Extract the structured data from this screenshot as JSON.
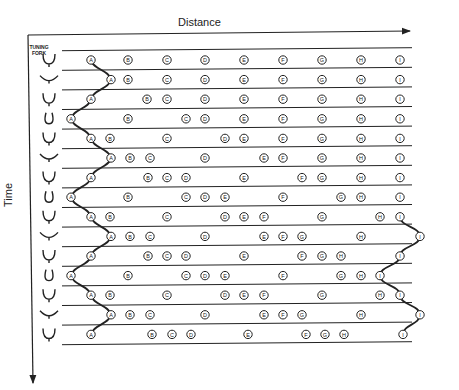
{
  "diagram": {
    "axes": {
      "x_label": "Distance",
      "y_label": "Time"
    },
    "fork_column_label": "TUNING FORK",
    "particle_labels": [
      "A",
      "B",
      "C",
      "D",
      "E",
      "F",
      "G",
      "H",
      "I"
    ],
    "rows": [
      {
        "fork_state": "neutral",
        "x": [
          91,
          128,
          167,
          205,
          244,
          283,
          322,
          361,
          400
        ]
      },
      {
        "fork_state": "spread",
        "x": [
          111,
          128,
          167,
          205,
          244,
          283,
          322,
          361,
          400
        ]
      },
      {
        "fork_state": "neutral",
        "x": [
          91,
          147,
          167,
          205,
          244,
          283,
          322,
          361,
          400
        ]
      },
      {
        "fork_state": "pinched",
        "x": [
          71,
          128,
          186,
          205,
          244,
          283,
          322,
          361,
          400
        ]
      },
      {
        "fork_state": "neutral",
        "x": [
          91,
          110,
          167,
          225,
          244,
          283,
          322,
          361,
          400
        ]
      },
      {
        "fork_state": "spread",
        "x": [
          111,
          130,
          150,
          205,
          264,
          283,
          322,
          361,
          400
        ]
      },
      {
        "fork_state": "neutral",
        "x": [
          91,
          148,
          167,
          186,
          244,
          302,
          322,
          361,
          400
        ]
      },
      {
        "fork_state": "pinched",
        "x": [
          71,
          128,
          186,
          205,
          225,
          283,
          341,
          361,
          400
        ]
      },
      {
        "fork_state": "neutral",
        "x": [
          91,
          110,
          167,
          225,
          244,
          264,
          322,
          380,
          400
        ]
      },
      {
        "fork_state": "spread",
        "x": [
          111,
          130,
          150,
          205,
          264,
          283,
          302,
          361,
          420
        ]
      },
      {
        "fork_state": "neutral",
        "x": [
          91,
          148,
          167,
          186,
          244,
          302,
          322,
          341,
          400
        ]
      },
      {
        "fork_state": "pinched",
        "x": [
          71,
          128,
          186,
          205,
          225,
          283,
          341,
          361,
          380
        ]
      },
      {
        "fork_state": "neutral",
        "x": [
          91,
          110,
          167,
          225,
          244,
          264,
          322,
          380,
          400
        ]
      },
      {
        "fork_state": "spread",
        "x": [
          111,
          130,
          150,
          205,
          264,
          283,
          302,
          361,
          420
        ]
      },
      {
        "fork_state": "neutral",
        "x": [
          91,
          152,
          172,
          191,
          248,
          306,
          325,
          344,
          403
        ]
      }
    ],
    "colors": {
      "ink": "#222222",
      "background": "#ffffff"
    }
  }
}
